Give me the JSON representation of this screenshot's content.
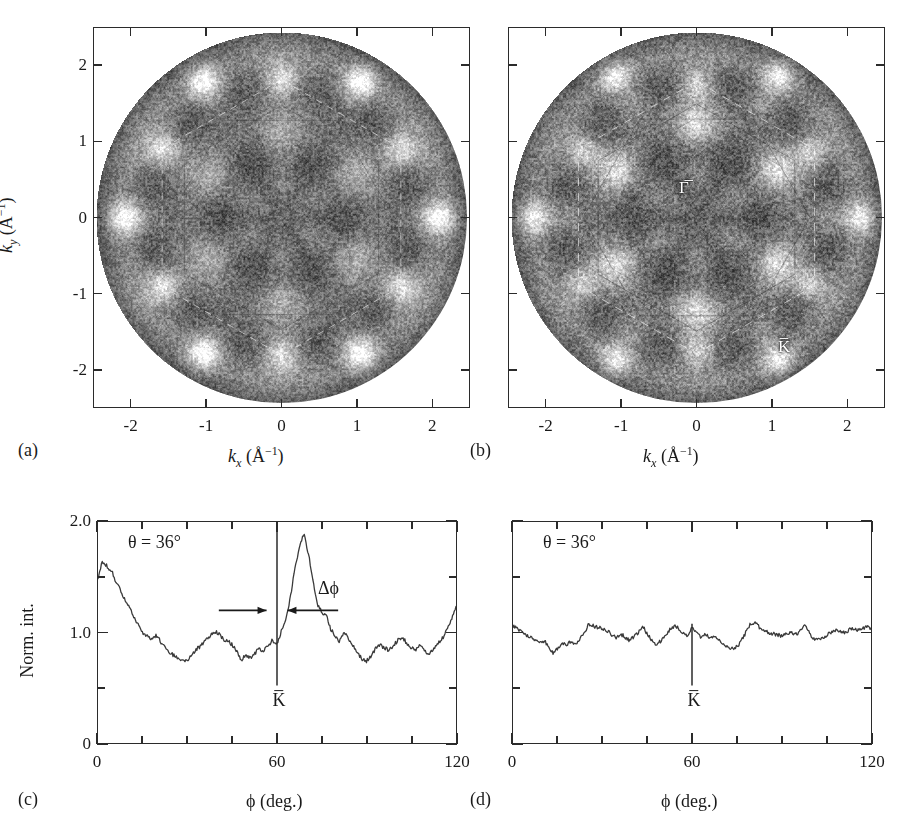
{
  "figure": {
    "panels": [
      "(a)",
      "(b)",
      "(c)",
      "(d)"
    ]
  },
  "panel_a": {
    "id": "(a)",
    "xlabel_k": "k",
    "xlabel_sub": "x",
    "xlabel_unit": "(Å",
    "xlabel_exp": "−1",
    "xlabel_close": ")",
    "ylabel_k": "k",
    "ylabel_sub": "y",
    "xticks": [
      "-2",
      "-1",
      "0",
      "1",
      "2"
    ],
    "yticks": [
      "2",
      "1",
      "0",
      "-1",
      "-2"
    ],
    "xlim": [
      -2.5,
      2.5
    ],
    "ylim": [
      -2.5,
      2.5
    ]
  },
  "panel_b": {
    "id": "(b)",
    "xticks": [
      "-2",
      "-1",
      "0",
      "1",
      "2"
    ],
    "yticks": [
      "2",
      "1",
      "0",
      "-1",
      "-2"
    ],
    "gamma_label": "Γ̅",
    "k_label": "K̅",
    "xlim": [
      -2.5,
      2.5
    ],
    "ylim": [
      -2.5,
      2.5
    ]
  },
  "panel_c": {
    "id": "(c)",
    "theta_label": "θ = 36°",
    "delta_label": "Δϕ",
    "k_label": "K̅",
    "ylabel": "Norm. int.",
    "xlabel": "ϕ (deg.)",
    "yticks": [
      "2.0",
      "1.0",
      "0"
    ],
    "xticks": [
      "0",
      "60",
      "120"
    ]
  },
  "panel_d": {
    "id": "(d)",
    "theta_label": "θ = 36°",
    "k_label": "K̅",
    "xlabel": "ϕ (deg.)",
    "xticks": [
      "0",
      "60",
      "120"
    ]
  },
  "chart_data": [
    {
      "type": "heatmap",
      "panel": "(a)",
      "title": "",
      "xlabel": "k_x (Å^-1)",
      "ylabel": "k_y (Å^-1)",
      "xlim": [
        -2.5,
        2.5
      ],
      "ylim": [
        -2.5,
        2.5
      ],
      "xticks": [
        -2,
        -1,
        0,
        1,
        2
      ],
      "yticks": [
        -2,
        -1,
        0,
        1,
        2
      ],
      "grid": false,
      "colormap": "gray",
      "description": "Circular photoelectron diffraction / k-space intensity map with six-fold symmetric bright spots, radius 2.45 inv-Angstrom",
      "symmetry_order": 6,
      "bright_spot_radii": [
        0.0,
        1.05,
        1.8,
        2.1
      ],
      "annotations": []
    },
    {
      "type": "heatmap",
      "panel": "(b)",
      "title": "",
      "xlabel": "k_x (Å^-1)",
      "ylabel": "",
      "xlim": [
        -2.5,
        2.5
      ],
      "ylim": [
        -2.5,
        2.5
      ],
      "xticks": [
        -2,
        -1,
        0,
        1,
        2
      ],
      "yticks": [
        -2,
        -1,
        0,
        1,
        2
      ],
      "grid": false,
      "colormap": "gray",
      "description": "Circular k-space intensity map with six-fold symmetry and overlaid Brillouin-zone hexagon outlines",
      "symmetry_order": 6,
      "bright_spot_radii": [
        0.0,
        1.2,
        1.75,
        2.15
      ],
      "annotations": [
        {
          "text": "Γ̅",
          "x": 0.05,
          "y": 0.52
        },
        {
          "text": "K̅",
          "x": 1.3,
          "y": -1.65
        }
      ]
    },
    {
      "type": "line",
      "panel": "(c)",
      "title": "",
      "xlabel": "ϕ (deg.)",
      "ylabel": "Norm. int.",
      "xlim": [
        0,
        120
      ],
      "ylim": [
        0,
        2.0
      ],
      "xticks": [
        0,
        15,
        30,
        45,
        60,
        75,
        90,
        105,
        120
      ],
      "xticklabels": {
        "0": "0",
        "60": "60",
        "120": "120"
      },
      "yticks": [
        0,
        0.5,
        1.0,
        1.5,
        2.0
      ],
      "yticklabels": {
        "0": "0",
        "1": "1.0",
        "2": "2.0"
      },
      "grid": false,
      "annotations": [
        {
          "text": "θ = 36°",
          "x": 10,
          "y": 1.78
        },
        {
          "text": "Δϕ",
          "x": 76,
          "y": 1.45
        },
        {
          "text": "K̅",
          "x": 60,
          "y": 0.42
        },
        {
          "type": "vline",
          "x": 60,
          "y0": 0.52,
          "y1": 1.93
        },
        {
          "type": "fwhm_arrows",
          "left": 40.5,
          "right": 80.5,
          "inner_left": 56.5,
          "inner_right": 63.5,
          "y": 1.2
        }
      ],
      "x": [
        0,
        1.5,
        3,
        4.5,
        6,
        7.5,
        9,
        10.5,
        12,
        13.5,
        15,
        16.5,
        18,
        19.5,
        21,
        22.5,
        24,
        25.5,
        27,
        28.5,
        30,
        31.5,
        33,
        34.5,
        36,
        37.5,
        39,
        40.5,
        42,
        43.5,
        45,
        46.5,
        48,
        49.5,
        51,
        52.5,
        54,
        55.5,
        57,
        58.5,
        60,
        61.5,
        63,
        64.5,
        66,
        67.5,
        69,
        70.5,
        72,
        73.5,
        75,
        76.5,
        78,
        79.5,
        81,
        82.5,
        84,
        85.5,
        87,
        88.5,
        90,
        91.5,
        93,
        94.5,
        96,
        97.5,
        99,
        100.5,
        102,
        103.5,
        105,
        106.5,
        108,
        109.5,
        111,
        112.5,
        114,
        115.5,
        117,
        118.5,
        120
      ],
      "y": [
        1.5,
        1.64,
        1.6,
        1.56,
        1.46,
        1.38,
        1.3,
        1.22,
        1.14,
        1.07,
        1.0,
        0.97,
        0.94,
        0.97,
        0.92,
        0.86,
        0.82,
        0.79,
        0.76,
        0.74,
        0.75,
        0.79,
        0.85,
        0.88,
        0.93,
        0.96,
        1.01,
        0.99,
        0.94,
        0.92,
        0.89,
        0.83,
        0.75,
        0.8,
        0.77,
        0.81,
        0.85,
        0.84,
        0.88,
        0.93,
        0.89,
        1.02,
        1.13,
        1.32,
        1.58,
        1.78,
        1.89,
        1.72,
        1.48,
        1.26,
        1.18,
        1.16,
        1.03,
        0.97,
        0.92,
        1.0,
        0.95,
        0.88,
        0.82,
        0.76,
        0.74,
        0.79,
        0.85,
        0.89,
        0.86,
        0.84,
        0.88,
        0.93,
        0.96,
        0.9,
        0.86,
        0.84,
        0.88,
        0.83,
        0.81,
        0.86,
        0.9,
        0.95,
        1.02,
        1.12,
        1.22
      ],
      "series_note": "single normalized azimuthal intensity scan; sharp K-bar peak at 60 deg"
    },
    {
      "type": "line",
      "panel": "(d)",
      "title": "",
      "xlabel": "ϕ (deg.)",
      "ylabel": "",
      "xlim": [
        0,
        120
      ],
      "ylim": [
        0,
        2.0
      ],
      "xticks": [
        0,
        15,
        30,
        45,
        60,
        75,
        90,
        105,
        120
      ],
      "xticklabels": {
        "0": "0",
        "60": "60",
        "120": "120"
      },
      "yticks": [
        0,
        0.5,
        1.0,
        1.5,
        2.0
      ],
      "grid": false,
      "annotations": [
        {
          "text": "θ = 36°",
          "x": 10,
          "y": 1.78
        },
        {
          "text": "K̅",
          "x": 60,
          "y": 0.42
        },
        {
          "type": "vline",
          "x": 60,
          "y0": 0.52,
          "y1": 1.08
        }
      ],
      "x": [
        0,
        1.5,
        3,
        4.5,
        6,
        7.5,
        9,
        10.5,
        12,
        13.5,
        15,
        16.5,
        18,
        19.5,
        21,
        22.5,
        24,
        25.5,
        27,
        28.5,
        30,
        31.5,
        33,
        34.5,
        36,
        37.5,
        39,
        40.5,
        42,
        43.5,
        45,
        46.5,
        48,
        49.5,
        51,
        52.5,
        54,
        55.5,
        57,
        58.5,
        60,
        61.5,
        63,
        64.5,
        66,
        67.5,
        69,
        70.5,
        72,
        73.5,
        75,
        76.5,
        78,
        79.5,
        81,
        82.5,
        84,
        85.5,
        87,
        88.5,
        90,
        91.5,
        93,
        94.5,
        96,
        97.5,
        99,
        100.5,
        102,
        103.5,
        105,
        106.5,
        108,
        109.5,
        111,
        112.5,
        114,
        115.5,
        117,
        118.5,
        120
      ],
      "y": [
        1.06,
        1.04,
        1.0,
        0.97,
        0.95,
        0.93,
        0.9,
        0.92,
        0.88,
        0.8,
        0.86,
        0.9,
        0.89,
        0.92,
        0.9,
        0.94,
        1.0,
        1.08,
        1.06,
        1.04,
        1.04,
        1.02,
        0.98,
        0.95,
        0.99,
        0.96,
        0.93,
        0.96,
        1.0,
        1.06,
        0.98,
        0.93,
        0.89,
        0.92,
        0.96,
        1.02,
        1.06,
        1.04,
        0.99,
        0.97,
        1.05,
        1.01,
        0.96,
        0.99,
        0.94,
        0.97,
        0.93,
        0.9,
        0.87,
        0.86,
        0.87,
        0.92,
        1.0,
        1.07,
        1.09,
        1.05,
        1.02,
        1.0,
        0.99,
        0.98,
        0.97,
        0.99,
        1.0,
        0.98,
        1.0,
        1.07,
        1.01,
        0.95,
        0.93,
        0.94,
        0.97,
        1.0,
        1.02,
        1.01,
        1.0,
        1.02,
        1.04,
        1.02,
        1.03,
        1.05,
        1.04
      ],
      "series_note": "single normalized azimuthal intensity scan; featureless, no K-bar peak"
    }
  ]
}
